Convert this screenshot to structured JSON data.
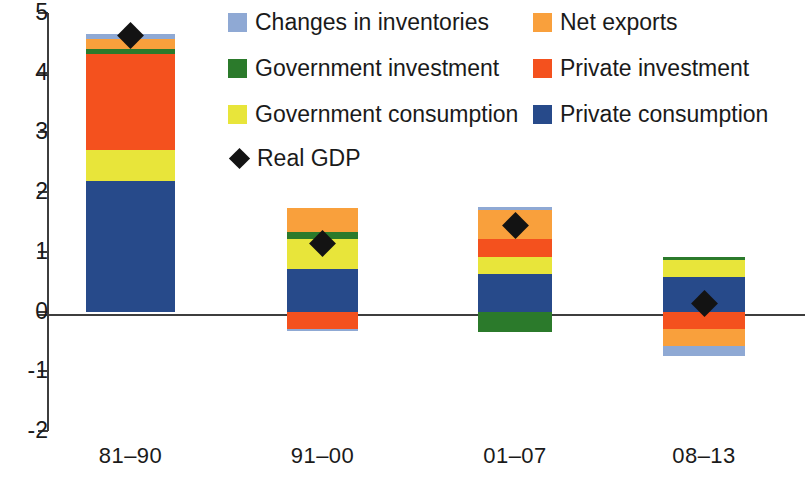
{
  "chart_data": {
    "type": "bar",
    "subtype": "stacked-bar-with-marker",
    "title": "",
    "xlabel": "",
    "ylabel": "",
    "ylim": [
      -2,
      5
    ],
    "yticks": [
      5,
      4,
      3,
      2,
      1,
      0,
      -1,
      -2
    ],
    "ytick_labels": [
      "5",
      "4",
      "3",
      "2",
      "1",
      "0",
      "-1",
      "-2"
    ],
    "grid": false,
    "categories": [
      "81–90",
      "91–00",
      "01–07",
      "08–13"
    ],
    "legend_position": "top-right",
    "series": [
      {
        "name": "Private consumption",
        "color": "#274a8a",
        "values": [
          2.19,
          0.71,
          0.63,
          0.58
        ]
      },
      {
        "name": "Government consumption",
        "color": "#e8e53a",
        "values": [
          0.52,
          0.5,
          0.29,
          0.28
        ]
      },
      {
        "name": "Private investment",
        "color": "#f4511e",
        "values": [
          1.6,
          -0.3,
          0.29,
          -0.3
        ]
      },
      {
        "name": "Government investment",
        "color": "#2b7a2b",
        "values": [
          0.09,
          0.13,
          -0.35,
          0.05
        ]
      },
      {
        "name": "Net exports",
        "color": "#f9a03c",
        "values": [
          0.17,
          0.39,
          0.49,
          -0.27
        ]
      },
      {
        "name": "Changes in inventories",
        "color": "#8fa9d4",
        "values": [
          0.08,
          -0.02,
          0.05,
          -0.17
        ]
      }
    ],
    "marker_series": {
      "name": "Real GDP",
      "marker": "diamond",
      "color": "#131313",
      "values": [
        4.63,
        1.14,
        1.44,
        0.13
      ]
    }
  },
  "legend": {
    "items": [
      {
        "label": "Changes in inventories",
        "color": "#8fa9d4",
        "type": "swatch"
      },
      {
        "label": "Net exports",
        "color": "#f9a03c",
        "type": "swatch"
      },
      {
        "label": "Government investment",
        "color": "#2b7a2b",
        "type": "swatch"
      },
      {
        "label": "Private investment",
        "color": "#f4511e",
        "type": "swatch"
      },
      {
        "label": "Government consumption",
        "color": "#e8e53a",
        "type": "swatch"
      },
      {
        "label": "Private consumption",
        "color": "#274a8a",
        "type": "swatch"
      },
      {
        "label": "Real GDP",
        "color": "#131313",
        "type": "diamond"
      }
    ]
  },
  "axis": {
    "line_color": "#3d3d3d"
  }
}
